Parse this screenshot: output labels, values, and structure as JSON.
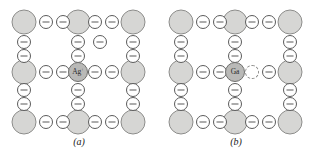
{
  "figure": {
    "type": "crystal-lattice-defect-diagram",
    "width": 315,
    "height": 158,
    "background": "#ffffff",
    "colors": {
      "host_cation_fill": "#d6d6d4",
      "host_cation_stroke": "#8d8d8b",
      "anion_fill": "#ffffff",
      "anion_stroke": "#5b5b5b",
      "dopant_fill": "#b9b9b7",
      "dopant_stroke": "#6f6f6d",
      "vacancy_stroke": "#8a8a88",
      "caption_color": "#1a1a1a"
    }
  },
  "panels": [
    {
      "id": "a",
      "caption": "(a)",
      "dopant": {
        "label": "Ag",
        "charge": "+",
        "x": 78,
        "y": 72
      },
      "large_cations": [
        {
          "x": 24,
          "y": 22
        },
        {
          "x": 78,
          "y": 22
        },
        {
          "x": 133,
          "y": 22
        },
        {
          "x": 24,
          "y": 72
        },
        {
          "x": 133,
          "y": 72
        },
        {
          "x": 24,
          "y": 122
        },
        {
          "x": 78,
          "y": 122
        },
        {
          "x": 133,
          "y": 122
        }
      ],
      "anions": [
        {
          "x": 46,
          "y": 22
        },
        {
          "x": 63,
          "y": 22
        },
        {
          "x": 95,
          "y": 22
        },
        {
          "x": 112,
          "y": 22
        },
        {
          "x": 24,
          "y": 42
        },
        {
          "x": 78,
          "y": 42
        },
        {
          "x": 100,
          "y": 42
        },
        {
          "x": 133,
          "y": 42
        },
        {
          "x": 24,
          "y": 56
        },
        {
          "x": 78,
          "y": 56
        },
        {
          "x": 133,
          "y": 56
        },
        {
          "x": 46,
          "y": 72
        },
        {
          "x": 63,
          "y": 72
        },
        {
          "x": 95,
          "y": 72
        },
        {
          "x": 112,
          "y": 72
        },
        {
          "x": 24,
          "y": 90
        },
        {
          "x": 78,
          "y": 90
        },
        {
          "x": 133,
          "y": 90
        },
        {
          "x": 24,
          "y": 104
        },
        {
          "x": 78,
          "y": 104
        },
        {
          "x": 133,
          "y": 104
        },
        {
          "x": 46,
          "y": 122
        },
        {
          "x": 63,
          "y": 122
        },
        {
          "x": 95,
          "y": 122
        },
        {
          "x": 112,
          "y": 122
        }
      ],
      "vacancies": []
    },
    {
      "id": "b",
      "caption": "(b)",
      "dopant": {
        "label": "Ga",
        "charge": "",
        "x": 78,
        "y": 72
      },
      "large_cations": [
        {
          "x": 24,
          "y": 22
        },
        {
          "x": 78,
          "y": 22
        },
        {
          "x": 133,
          "y": 22
        },
        {
          "x": 24,
          "y": 72
        },
        {
          "x": 133,
          "y": 72
        },
        {
          "x": 24,
          "y": 122
        },
        {
          "x": 78,
          "y": 122
        },
        {
          "x": 133,
          "y": 122
        }
      ],
      "anions": [
        {
          "x": 46,
          "y": 22
        },
        {
          "x": 63,
          "y": 22
        },
        {
          "x": 95,
          "y": 22
        },
        {
          "x": 112,
          "y": 22
        },
        {
          "x": 24,
          "y": 42
        },
        {
          "x": 78,
          "y": 42
        },
        {
          "x": 133,
          "y": 42
        },
        {
          "x": 24,
          "y": 56
        },
        {
          "x": 78,
          "y": 56
        },
        {
          "x": 133,
          "y": 56
        },
        {
          "x": 46,
          "y": 72
        },
        {
          "x": 63,
          "y": 72
        },
        {
          "x": 112,
          "y": 72
        },
        {
          "x": 24,
          "y": 90
        },
        {
          "x": 78,
          "y": 90
        },
        {
          "x": 133,
          "y": 90
        },
        {
          "x": 24,
          "y": 104
        },
        {
          "x": 78,
          "y": 104
        },
        {
          "x": 133,
          "y": 104
        },
        {
          "x": 46,
          "y": 122
        },
        {
          "x": 63,
          "y": 122
        },
        {
          "x": 95,
          "y": 122
        },
        {
          "x": 112,
          "y": 122
        }
      ],
      "vacancies": [
        {
          "x": 95,
          "y": 72
        }
      ]
    }
  ]
}
